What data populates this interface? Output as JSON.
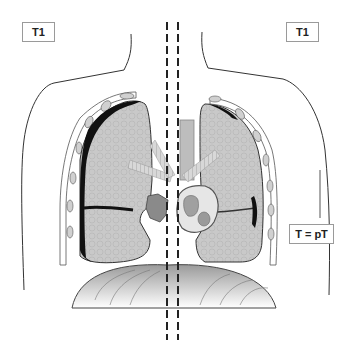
{
  "diagram": {
    "type": "anatomical-illustration",
    "labels": {
      "left_stage": "T1",
      "right_stage": "T1",
      "pathologic": "T = pT"
    },
    "colors": {
      "outline": "#333333",
      "lung_fill": "#c8c8c8",
      "pleural_tumor": "#111111",
      "diaphragm_fill": "#bdbdbd",
      "mediastinum": "#8a8a8a",
      "label_border": "#9a9a9a"
    }
  }
}
